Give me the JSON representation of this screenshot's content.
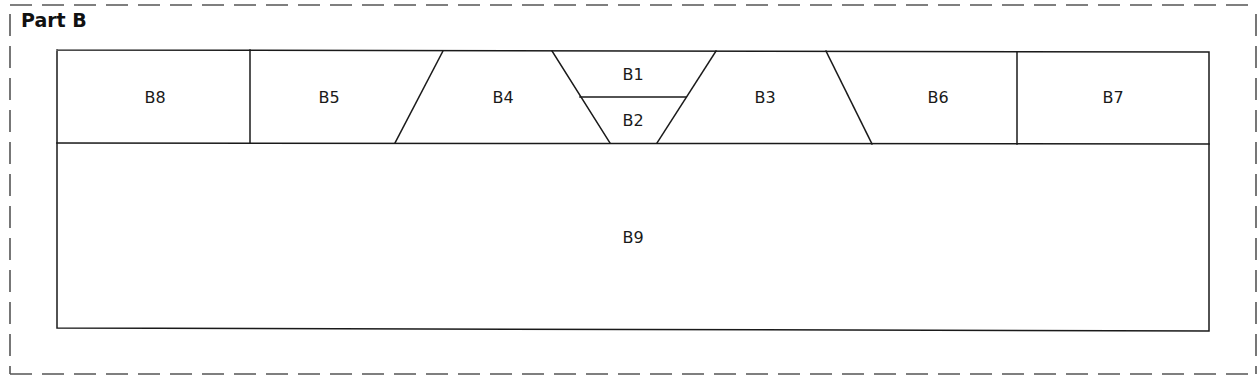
{
  "title": "Part B",
  "colors": {
    "line": "#1a1a1a",
    "dashed_border": "#555555",
    "background": "#ffffff"
  },
  "regions": [
    {
      "id": "B8",
      "label": "B8",
      "label_x": 155,
      "label_y": 98
    },
    {
      "id": "B5",
      "label": "B5",
      "label_x": 329,
      "label_y": 98
    },
    {
      "id": "B4",
      "label": "B4",
      "label_x": 503,
      "label_y": 98
    },
    {
      "id": "B1",
      "label": "B1",
      "label_x": 633,
      "label_y": 75
    },
    {
      "id": "B2",
      "label": "B2",
      "label_x": 633,
      "label_y": 121
    },
    {
      "id": "B3",
      "label": "B3",
      "label_x": 765,
      "label_y": 98
    },
    {
      "id": "B6",
      "label": "B6",
      "label_x": 938,
      "label_y": 98
    },
    {
      "id": "B7",
      "label": "B7",
      "label_x": 1113,
      "label_y": 98
    },
    {
      "id": "B9",
      "label": "B9",
      "label_x": 633,
      "label_y": 238
    }
  ]
}
